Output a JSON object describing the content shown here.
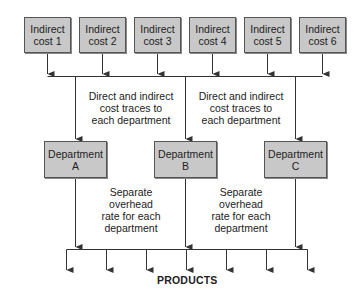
{
  "indirect_costs": [
    {
      "line1": "Indirect",
      "line2": "cost 1"
    },
    {
      "line1": "Indirect",
      "line2": "cost 2"
    },
    {
      "line1": "Indirect",
      "line2": "cost 3"
    },
    {
      "line1": "Indirect",
      "line2": "cost 4"
    },
    {
      "line1": "Indirect",
      "line2": "cost 5"
    },
    {
      "line1": "Indirect",
      "line2": "cost 6"
    }
  ],
  "trace_labels": [
    {
      "line1": "Direct and indirect",
      "line2": "cost traces to",
      "line3": "each department"
    },
    {
      "line1": "Direct and indirect",
      "line2": "cost traces to",
      "line3": "each department"
    }
  ],
  "departments": [
    {
      "line1": "Department",
      "line2": "A"
    },
    {
      "line1": "Department",
      "line2": "B"
    },
    {
      "line1": "Department",
      "line2": "C"
    }
  ],
  "rate_labels": [
    {
      "line1": "Separate",
      "line2": "overhead",
      "line3": "rate for each",
      "line4": "department"
    },
    {
      "line1": "Separate",
      "line2": "overhead",
      "line3": "rate for each",
      "line4": "department"
    }
  ],
  "products_label": "PRODUCTS",
  "colors": {
    "box_fill": "#c8c8c8",
    "box_border": "#555555",
    "line": "#333333"
  }
}
